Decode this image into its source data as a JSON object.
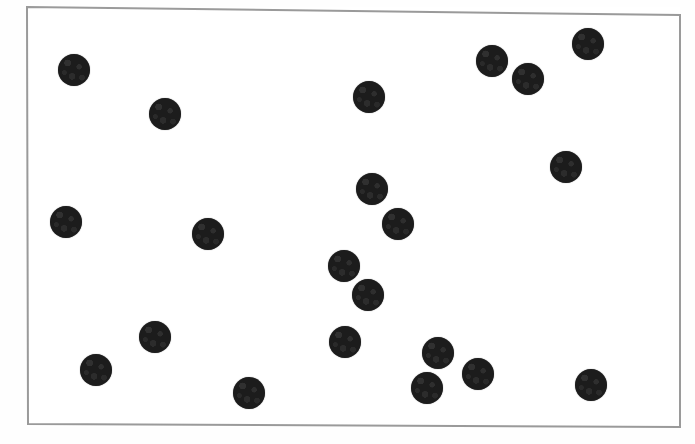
{
  "image": {
    "kind": "scanned-figure",
    "width": 695,
    "height": 444,
    "background_color": "#fefefe",
    "caption": ""
  },
  "frame": {
    "name": "rectangular-border",
    "stroke_color": "#9a9a9a",
    "stroke_width": 2,
    "fill_color": "#ffffff",
    "corners": {
      "top_left": [
        27,
        7
      ],
      "top_right": [
        680,
        15
      ],
      "bottom_right": [
        680,
        427
      ],
      "bottom_left": [
        28,
        424
      ]
    }
  },
  "chart_data": {
    "type": "scatter",
    "title": "",
    "xlabel": "",
    "ylabel": "",
    "grid": false,
    "legend": "none",
    "xlim": [
      27,
      680
    ],
    "ylim": [
      7,
      427
    ],
    "marker": {
      "shape": "circle",
      "color": "#1c1c1c",
      "diameter_px": 32
    },
    "count": 21,
    "points": [
      {
        "id": 1,
        "x": 74,
        "y": 70,
        "r": 16
      },
      {
        "id": 2,
        "x": 165,
        "y": 114,
        "r": 16
      },
      {
        "id": 3,
        "x": 369,
        "y": 97,
        "r": 16
      },
      {
        "id": 4,
        "x": 492,
        "y": 61,
        "r": 16
      },
      {
        "id": 5,
        "x": 528,
        "y": 79,
        "r": 16
      },
      {
        "id": 6,
        "x": 588,
        "y": 44,
        "r": 16
      },
      {
        "id": 7,
        "x": 566,
        "y": 167,
        "r": 16
      },
      {
        "id": 8,
        "x": 372,
        "y": 189,
        "r": 16
      },
      {
        "id": 9,
        "x": 398,
        "y": 224,
        "r": 16
      },
      {
        "id": 10,
        "x": 66,
        "y": 222,
        "r": 16
      },
      {
        "id": 11,
        "x": 208,
        "y": 234,
        "r": 16
      },
      {
        "id": 12,
        "x": 344,
        "y": 266,
        "r": 16
      },
      {
        "id": 13,
        "x": 368,
        "y": 295,
        "r": 16
      },
      {
        "id": 14,
        "x": 155,
        "y": 337,
        "r": 16
      },
      {
        "id": 15,
        "x": 345,
        "y": 342,
        "r": 16
      },
      {
        "id": 16,
        "x": 96,
        "y": 370,
        "r": 16
      },
      {
        "id": 17,
        "x": 438,
        "y": 353,
        "r": 16
      },
      {
        "id": 18,
        "x": 478,
        "y": 374,
        "r": 16
      },
      {
        "id": 19,
        "x": 427,
        "y": 388,
        "r": 16
      },
      {
        "id": 20,
        "x": 249,
        "y": 393,
        "r": 16
      },
      {
        "id": 21,
        "x": 591,
        "y": 385,
        "r": 16
      }
    ]
  }
}
